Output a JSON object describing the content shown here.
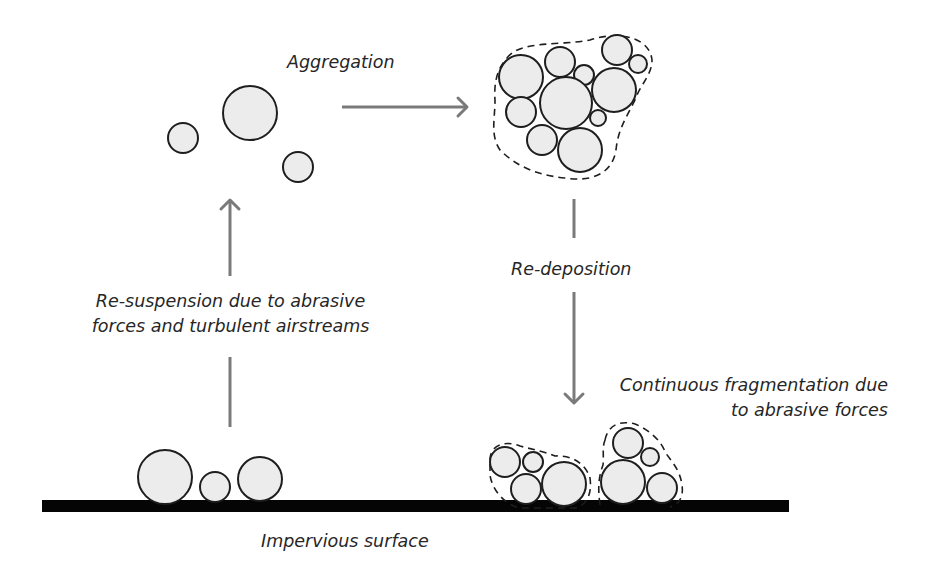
{
  "labels": {
    "aggregation": "Aggregation",
    "resuspension_line1": "Re-suspension due to abrasive",
    "resuspension_line2": "forces and turbulent airstreams",
    "redeposition": "Re-deposition",
    "fragmentation_line1": "Continuous fragmentation due",
    "fragmentation_line2": "to abrasive forces",
    "surface": "Impervious surface"
  },
  "colors": {
    "particle_fill": "#ececec",
    "particle_stroke": "#1e1e1e",
    "arrow": "#7a7a7a",
    "surface": "#050505",
    "text": "#262626"
  },
  "diagram": {
    "airborne_particles": [
      {
        "cx": 183,
        "cy": 138,
        "r": 15
      },
      {
        "cx": 250,
        "cy": 113,
        "r": 27
      },
      {
        "cx": 298,
        "cy": 167,
        "r": 15
      }
    ],
    "aggregate_particles": [
      {
        "cx": 521,
        "cy": 77,
        "r": 22
      },
      {
        "cx": 560,
        "cy": 62,
        "r": 15
      },
      {
        "cx": 584,
        "cy": 75,
        "r": 10
      },
      {
        "cx": 617,
        "cy": 50,
        "r": 15
      },
      {
        "cx": 638,
        "cy": 64,
        "r": 9
      },
      {
        "cx": 614,
        "cy": 90,
        "r": 22
      },
      {
        "cx": 566,
        "cy": 103,
        "r": 26
      },
      {
        "cx": 521,
        "cy": 112,
        "r": 15
      },
      {
        "cx": 598,
        "cy": 118,
        "r": 8
      },
      {
        "cx": 542,
        "cy": 140,
        "r": 15
      },
      {
        "cx": 580,
        "cy": 150,
        "r": 22
      }
    ],
    "aggregate_envelope": "M 507 58 C 520 40, 560 46, 590 40 C 620 30, 650 38, 652 60 C 652 75, 640 85, 635 100 C 625 120, 618 130, 616 150 C 612 175, 590 182, 565 178 C 535 175, 515 165, 500 150 C 490 135, 495 120, 495 100 C 494 85, 496 70, 507 58 Z",
    "ground_particles_left": [
      {
        "cx": 165,
        "cy": 477,
        "r": 27
      },
      {
        "cx": 215,
        "cy": 487,
        "r": 15
      },
      {
        "cx": 260,
        "cy": 479,
        "r": 22
      }
    ],
    "fragment_cluster_a": [
      {
        "cx": 505,
        "cy": 462,
        "r": 15
      },
      {
        "cx": 533,
        "cy": 462,
        "r": 10
      },
      {
        "cx": 526,
        "cy": 489,
        "r": 15
      },
      {
        "cx": 564,
        "cy": 484,
        "r": 22
      }
    ],
    "fragment_cluster_a_envelope": "M 490 460 C 490 445, 505 440, 520 446 C 535 450, 545 452, 555 456 C 570 455, 585 462, 590 478 C 592 492, 588 505, 575 508 L 520 508 C 505 505, 492 490, 490 475 Z",
    "fragment_cluster_b": [
      {
        "cx": 628,
        "cy": 443,
        "r": 15
      },
      {
        "cx": 650,
        "cy": 457,
        "r": 9
      },
      {
        "cx": 623,
        "cy": 482,
        "r": 22
      },
      {
        "cx": 662,
        "cy": 488,
        "r": 15
      }
    ],
    "fragment_cluster_b_envelope": "M 605 440 C 608 425, 620 420, 635 424 C 650 430, 662 442, 665 452 C 672 462, 680 470, 682 485 C 684 498, 678 505, 670 507 M 600 505 C 598 490, 598 478, 603 465 C 604 455, 602 448, 605 440",
    "surface_bar": {
      "x": 42,
      "y": 500,
      "width": 747,
      "height": 12
    },
    "arrows": {
      "aggregation": {
        "x1": 342,
        "y1": 107,
        "x2": 467,
        "y2": 107
      },
      "resuspension_upper": {
        "x1": 230,
        "y1": 276,
        "x2": 230,
        "y2": 200
      },
      "resuspension_lower": {
        "x1": 230,
        "y1": 427,
        "x2": 230,
        "y2": 357
      },
      "redeposition_upper": {
        "x1": 574,
        "y1": 199,
        "x2": 574,
        "y2": 238
      },
      "redeposition_lower": {
        "x1": 574,
        "y1": 292,
        "x2": 574,
        "y2": 403
      }
    }
  }
}
